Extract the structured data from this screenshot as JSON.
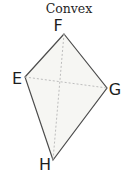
{
  "title": "Convex",
  "diagram": {
    "shape": "kite-quadrilateral",
    "fill_color": "#f6f6f3",
    "outline_color": "#4c4c4c",
    "diagonal_color": "#bdbdbd",
    "label_color": "#1d1d1d",
    "vertices": [
      {
        "label": "F",
        "x": 64,
        "y": 34,
        "label_x": 58,
        "label_y": 31
      },
      {
        "label": "E",
        "x": 25,
        "y": 77,
        "label_x": 17,
        "label_y": 84
      },
      {
        "label": "G",
        "x": 107,
        "y": 88,
        "label_x": 115,
        "label_y": 95
      },
      {
        "label": "H",
        "x": 53,
        "y": 160,
        "label_x": 45,
        "label_y": 170
      }
    ],
    "polygon_order": [
      "F",
      "G",
      "H",
      "E"
    ],
    "diagonals": [
      [
        "E",
        "G"
      ],
      [
        "F",
        "H"
      ]
    ]
  }
}
